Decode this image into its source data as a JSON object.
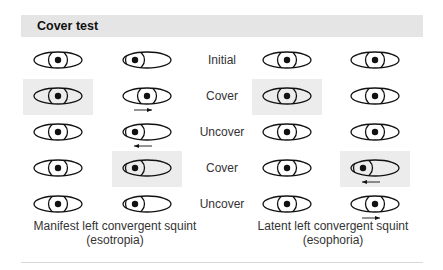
{
  "header": {
    "title": "Cover test"
  },
  "row_labels": [
    "Initial",
    "Cover",
    "Uncover",
    "Cover",
    "Uncover"
  ],
  "captions": {
    "left_line1": "Manifest left convergent squint",
    "left_line2": "(esotropia)",
    "right_line1": "Latent left convergent squint",
    "right_line2": "(esophoria)"
  },
  "grid": {
    "columns": [
      {
        "group": "esotropia",
        "eye": "right"
      },
      {
        "group": "esotropia",
        "eye": "left"
      },
      {
        "group": "esophoria",
        "eye": "right"
      },
      {
        "group": "esophoria",
        "eye": "left"
      }
    ],
    "rows": [
      {
        "label": "Initial",
        "cells": [
          {
            "iris": "center",
            "covered": false,
            "arrow": "none"
          },
          {
            "iris": "inward",
            "covered": false,
            "arrow": "none"
          },
          {
            "iris": "center",
            "covered": false,
            "arrow": "none"
          },
          {
            "iris": "center",
            "covered": false,
            "arrow": "none"
          }
        ]
      },
      {
        "label": "Cover",
        "cells": [
          {
            "iris": "center",
            "covered": true,
            "arrow": "none"
          },
          {
            "iris": "center",
            "covered": false,
            "arrow": "right"
          },
          {
            "iris": "center",
            "covered": true,
            "arrow": "none"
          },
          {
            "iris": "center",
            "covered": false,
            "arrow": "none"
          }
        ]
      },
      {
        "label": "Uncover",
        "cells": [
          {
            "iris": "center",
            "covered": false,
            "arrow": "none"
          },
          {
            "iris": "inward",
            "covered": false,
            "arrow": "left"
          },
          {
            "iris": "center",
            "covered": false,
            "arrow": "none"
          },
          {
            "iris": "center",
            "covered": false,
            "arrow": "none"
          }
        ]
      },
      {
        "label": "Cover",
        "cells": [
          {
            "iris": "center",
            "covered": false,
            "arrow": "none"
          },
          {
            "iris": "inward",
            "covered": true,
            "arrow": "none"
          },
          {
            "iris": "center",
            "covered": false,
            "arrow": "none"
          },
          {
            "iris": "inward",
            "covered": true,
            "arrow": "left"
          }
        ]
      },
      {
        "label": "Uncover",
        "cells": [
          {
            "iris": "center",
            "covered": false,
            "arrow": "none"
          },
          {
            "iris": "inward",
            "covered": false,
            "arrow": "none"
          },
          {
            "iris": "center",
            "covered": false,
            "arrow": "none"
          },
          {
            "iris": "center",
            "covered": false,
            "arrow": "right"
          }
        ]
      }
    ]
  },
  "colors": {
    "header_bg": "#e5e5e5",
    "highlight_bg": "#ececec",
    "stroke": "#111111",
    "divider": "#d8d8d8"
  }
}
